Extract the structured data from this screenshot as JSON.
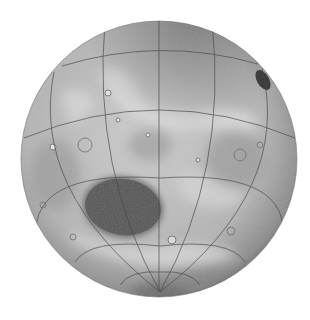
{
  "image": {
    "subject": "Shaded relief globe of a planet with latitude/longitude graticule",
    "width": 310,
    "height": 320,
    "background": "#ffffff"
  },
  "globe": {
    "cx": 159,
    "cy": 159,
    "r": 138,
    "colors": {
      "light": "#d2d2d2",
      "mid": "#a8a8a8",
      "shadow": "#6e6e6e",
      "basin": "#4e4e4e",
      "grid": "#4a4a4a"
    },
    "basin": {
      "cx": 123,
      "cy": 207,
      "rx": 38,
      "ry": 28,
      "rotate": 8
    },
    "dark_crater": {
      "cx": 263,
      "cy": 80,
      "rx": 7,
      "ry": 12,
      "rotate": -30
    },
    "south_pole": {
      "x": 160,
      "y": 292
    }
  },
  "graticule": {
    "meridians_at_equator_x": [
      42,
      97,
      159,
      222,
      277
    ],
    "parallels_at_center_y": [
      49,
      106,
      178,
      246,
      272
    ]
  }
}
